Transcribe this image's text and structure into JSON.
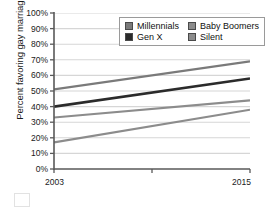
{
  "chart_data": {
    "type": "line",
    "title": "",
    "xlabel": "",
    "ylabel": "Percent favoring gay marriage",
    "x": [
      2003,
      2015
    ],
    "xlim": [
      2003,
      2015
    ],
    "ylim": [
      0,
      100
    ],
    "xtick_labels": [
      "2003",
      "2015"
    ],
    "ytick_labels": [
      "100%",
      "90%",
      "80%",
      "70%",
      "60%",
      "50%",
      "40%",
      "30%",
      "20%",
      "10%",
      "0%"
    ],
    "ytick_values": [
      100,
      90,
      80,
      70,
      60,
      50,
      40,
      30,
      20,
      10,
      0
    ],
    "grid": true,
    "legend_position": "top-right",
    "series": [
      {
        "name": "Millennials",
        "values": [
          51,
          69
        ],
        "color": "#7a7a7a"
      },
      {
        "name": "Gen X",
        "values": [
          40,
          58
        ],
        "color": "#2b2b2b"
      },
      {
        "name": "Baby Boomers",
        "values": [
          33,
          44
        ],
        "color": "#8c8c8c"
      },
      {
        "name": "Silent",
        "values": [
          17,
          38
        ],
        "color": "#8c8c8c"
      }
    ]
  },
  "legend": {
    "entries": [
      {
        "label": "Millennials",
        "swatch": "#7a7a7a"
      },
      {
        "label": "Baby Boomers",
        "swatch": "#8c8c8c"
      },
      {
        "label": "Gen X",
        "swatch": "#2b2b2b"
      },
      {
        "label": "Silent",
        "swatch": "#8c8c8c"
      }
    ]
  },
  "colors": {
    "axis": "#595959",
    "grid": "#d6d6d6",
    "text": "#1a1a1a",
    "background": "#ffffff"
  }
}
